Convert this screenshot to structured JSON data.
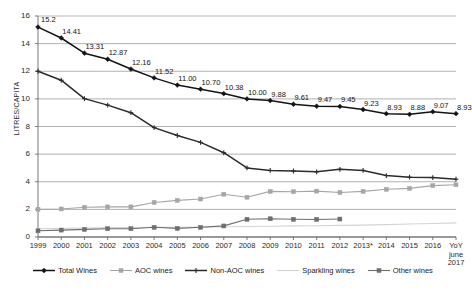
{
  "axes": {
    "ylabel": "LITRES/CAPITA",
    "yticks": [
      0,
      2,
      4,
      6,
      8,
      10,
      12,
      14,
      16
    ],
    "xticks": [
      "1999",
      "2000",
      "2001",
      "2002",
      "2003",
      "2004",
      "2005",
      "2006",
      "2007",
      "2008",
      "2009",
      "2010",
      "2011",
      "2012",
      "2013*",
      "2014",
      "2015",
      "2016",
      "YoY june 2017"
    ],
    "last_tick_lines": [
      "YoY",
      "june",
      "2017"
    ]
  },
  "legend": {
    "items": [
      {
        "label": "Total Wines",
        "color": "#141414",
        "marker": "diamond"
      },
      {
        "label": "AOC wines",
        "color": "#a6a6a6",
        "marker": "square"
      },
      {
        "label": "Non-AOC wines",
        "color": "#2b2b2b",
        "marker": "plus"
      },
      {
        "label": "Sparkling wines",
        "color": "#d4d4d4",
        "marker": "none"
      },
      {
        "label": "Other wines",
        "color": "#6e6e6e",
        "marker": "square"
      }
    ]
  },
  "chart_data": {
    "type": "line",
    "title": "",
    "xlabel": "",
    "ylabel": "LITRES/CAPITA",
    "ylim": [
      0,
      16
    ],
    "grid": true,
    "legend_position": "bottom",
    "categories": [
      "1999",
      "2000",
      "2001",
      "2002",
      "2003",
      "2004",
      "2005",
      "2006",
      "2007",
      "2008",
      "2009",
      "2010",
      "2011",
      "2012",
      "2013*",
      "2014",
      "2015",
      "2016",
      "YoY june 2017"
    ],
    "series": [
      {
        "name": "Total Wines",
        "color": "#141414",
        "values": [
          15.2,
          14.41,
          13.31,
          12.87,
          12.16,
          11.52,
          11.0,
          10.7,
          10.38,
          10.0,
          9.88,
          9.61,
          9.47,
          9.45,
          9.23,
          8.93,
          8.88,
          9.07,
          8.93
        ],
        "labels": [
          "15.2",
          "14.41",
          "13.31",
          "12.87",
          "12.16",
          "11.52",
          "11.00",
          "10.70",
          "10.38",
          "10.00",
          "9.88",
          "9.61",
          "9.47",
          "9.45",
          "9.23",
          "8.93",
          "8.88",
          "9.07",
          "8.93"
        ]
      },
      {
        "name": "Non-AOC wines",
        "color": "#2b2b2b",
        "values": [
          12.0,
          11.35,
          10.02,
          9.55,
          9.0,
          7.92,
          7.35,
          6.85,
          6.1,
          5.0,
          4.82,
          4.78,
          4.72,
          4.9,
          4.82,
          4.45,
          4.33,
          4.3,
          4.18
        ],
        "labels": []
      },
      {
        "name": "AOC wines",
        "color": "#a6a6a6",
        "values": [
          2.0,
          2.03,
          2.15,
          2.18,
          2.18,
          2.5,
          2.65,
          2.75,
          3.1,
          2.88,
          3.3,
          3.28,
          3.32,
          3.22,
          3.3,
          3.45,
          3.52,
          3.72,
          3.78
        ],
        "labels": []
      },
      {
        "name": "Other wines",
        "color": "#6e6e6e",
        "values": [
          0.45,
          0.5,
          0.55,
          0.6,
          0.6,
          0.7,
          0.62,
          0.7,
          0.8,
          1.28,
          1.32,
          1.28,
          1.27,
          1.3,
          null,
          null,
          null,
          null,
          null
        ],
        "labels": []
      },
      {
        "name": "Sparkling wines",
        "color": "#d4d4d4",
        "values": [
          0.6,
          0.62,
          0.65,
          0.68,
          0.68,
          0.7,
          0.7,
          0.72,
          0.74,
          0.76,
          0.78,
          0.8,
          0.82,
          0.84,
          0.86,
          0.9,
          0.94,
          0.98,
          1.02
        ],
        "labels": []
      }
    ]
  }
}
